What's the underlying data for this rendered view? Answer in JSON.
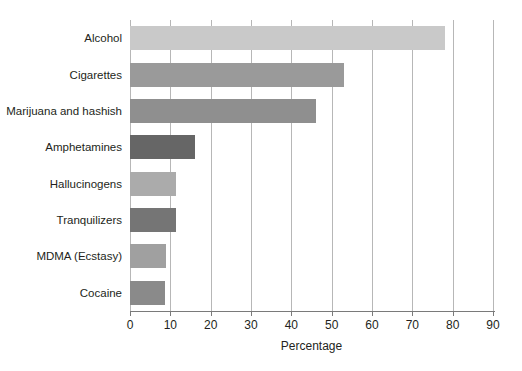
{
  "chart_data": {
    "type": "bar",
    "orientation": "horizontal",
    "title": "",
    "xlabel": "Percentage",
    "ylabel": "",
    "xlim": [
      0,
      90
    ],
    "xticks": [
      0,
      10,
      20,
      30,
      40,
      50,
      60,
      70,
      80,
      90
    ],
    "xtick_labels": [
      "0",
      "10",
      "20",
      "30",
      "40",
      "50",
      "60",
      "70",
      "80",
      "90"
    ],
    "grid": "vertical",
    "legend": "none",
    "categories": [
      "Alcohol",
      "Cigarettes",
      "Marijuana and hashish",
      "Amphetamines",
      "Hallucinogens",
      "Tranquilizers",
      "MDMA (Ecstasy)",
      "Cocaine"
    ],
    "values": [
      78,
      53,
      46,
      16,
      11.5,
      11.5,
      9,
      8.7
    ],
    "bar_colors": [
      "#c9c9c9",
      "#9a9a9a",
      "#8f8f8f",
      "#666666",
      "#ababab",
      "#757575",
      "#a0a0a0",
      "#8a8a8a"
    ]
  }
}
